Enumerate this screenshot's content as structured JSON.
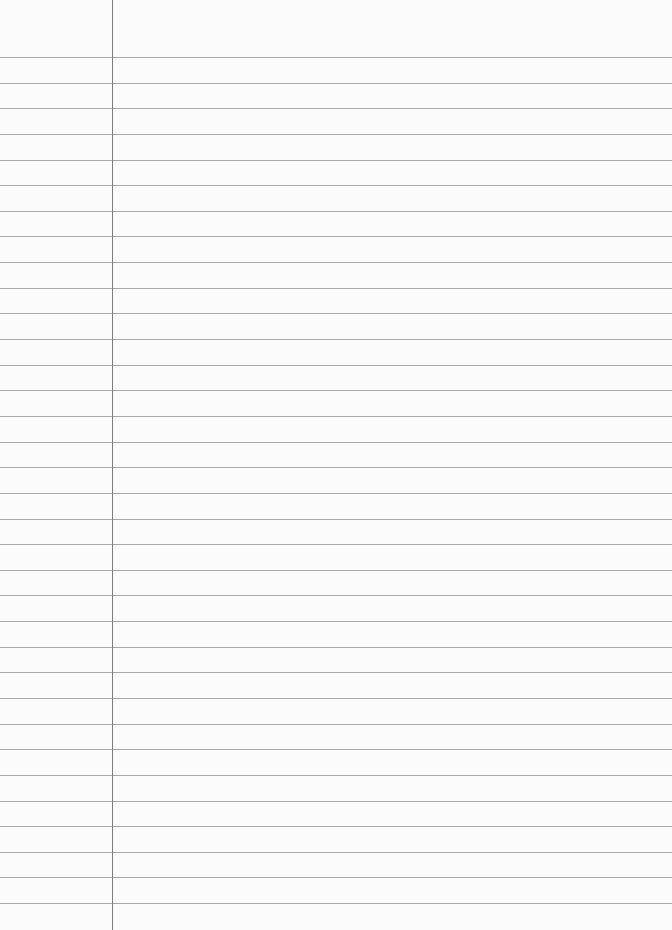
{
  "page": {
    "type": "lined-paper",
    "background_color": "#fbfbfb",
    "rule_color": "#a9a9a9",
    "margin_color": "#7d7d7d",
    "margin_x": 112,
    "first_rule_y": 57,
    "rule_spacing": 25.64,
    "rule_count": 34,
    "text": ""
  }
}
